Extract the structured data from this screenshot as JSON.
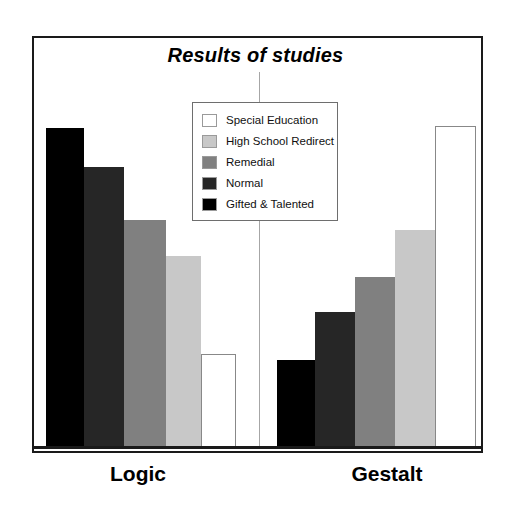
{
  "chart": {
    "title": "Results of studies"
  },
  "legend": {
    "items": [
      {
        "label": "Special Education",
        "color": "#ffffff"
      },
      {
        "label": "High School Redirect",
        "color": "#c8c8c8"
      },
      {
        "label": "Remedial",
        "color": "#808080"
      },
      {
        "label": "Normal",
        "color": "#262626"
      },
      {
        "label": "Gifted & Talented",
        "color": "#000000"
      }
    ]
  },
  "axis": {
    "categories": [
      "Logic",
      "Gestalt"
    ]
  },
  "chart_data": {
    "type": "bar",
    "title": "Results of studies",
    "xlabel": "",
    "ylabel": "",
    "grid": false,
    "legend_position": "center-top-inside",
    "categories": [
      "Logic",
      "Gestalt"
    ],
    "ylim": [
      0,
      100
    ],
    "series": [
      {
        "name": "Gifted & Talented",
        "color": "#000000",
        "values": [
          100,
          27
        ]
      },
      {
        "name": "Normal",
        "color": "#262626",
        "values": [
          88,
          42
        ]
      },
      {
        "name": "Remedial",
        "color": "#808080",
        "values": [
          71,
          53
        ]
      },
      {
        "name": "High School Redirect",
        "color": "#c8c8c8",
        "values": [
          60,
          68
        ]
      },
      {
        "name": "Special Education",
        "color": "#ffffff",
        "values": [
          29,
          101
        ]
      }
    ]
  },
  "bars": [
    {
      "name": "logic-gifted-talented",
      "group": "Logic",
      "series": "Gifted & Talented",
      "color": "#000000",
      "x": 46,
      "w": 38,
      "top": 128,
      "value": 100
    },
    {
      "name": "logic-normal",
      "group": "Logic",
      "series": "Normal",
      "color": "#262626",
      "x": 84,
      "w": 40,
      "top": 167,
      "value": 88
    },
    {
      "name": "logic-remedial",
      "group": "Logic",
      "series": "Remedial",
      "color": "#808080",
      "x": 124,
      "w": 42,
      "top": 220,
      "value": 71
    },
    {
      "name": "logic-high-school-redirect",
      "group": "Logic",
      "series": "High School Redirect",
      "color": "#c8c8c8",
      "x": 166,
      "w": 35,
      "top": 256,
      "value": 60
    },
    {
      "name": "logic-special-education",
      "group": "Logic",
      "series": "Special Education",
      "color": "#ffffff",
      "x": 201,
      "w": 35,
      "top": 354,
      "value": 29
    },
    {
      "name": "gestalt-gifted-talented",
      "group": "Gestalt",
      "series": "Gifted & Talented",
      "color": "#000000",
      "x": 277,
      "w": 38,
      "top": 360,
      "value": 27
    },
    {
      "name": "gestalt-normal",
      "group": "Gestalt",
      "series": "Normal",
      "color": "#262626",
      "x": 315,
      "w": 40,
      "top": 312,
      "value": 42
    },
    {
      "name": "gestalt-remedial",
      "group": "Gestalt",
      "series": "Remedial",
      "color": "#808080",
      "x": 355,
      "w": 40,
      "top": 277,
      "value": 53
    },
    {
      "name": "gestalt-high-school-redirect",
      "group": "Gestalt",
      "series": "High School Redirect",
      "color": "#c8c8c8",
      "x": 395,
      "w": 40,
      "top": 230,
      "value": 68
    },
    {
      "name": "gestalt-special-education",
      "group": "Gestalt",
      "series": "Special Education",
      "color": "#ffffff",
      "x": 435,
      "w": 41,
      "top": 126,
      "value": 101
    }
  ]
}
